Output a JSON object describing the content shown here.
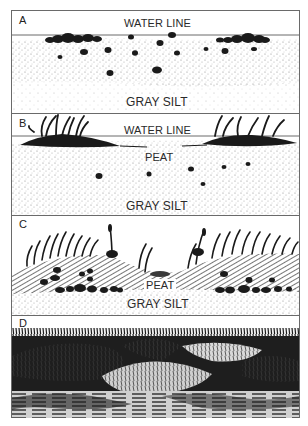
{
  "figure": {
    "panels": [
      {
        "id": "A",
        "label": "A",
        "labels": {
          "water_line": "WATER LINE",
          "silt": "GRAY SILT"
        }
      },
      {
        "id": "B",
        "label": "B",
        "labels": {
          "water_line": "WATER LINE",
          "peat": "PEAT",
          "silt": "GRAY SILT"
        }
      },
      {
        "id": "C",
        "label": "C",
        "labels": {
          "peat": "PEAT",
          "silt": "GRAY SILT"
        }
      },
      {
        "id": "D",
        "label": "D",
        "labels": {}
      }
    ],
    "colors": {
      "ink": "#1a1a1a",
      "frame": "#6a6a6a",
      "silt_stipple": "#9a9a9a",
      "paper": "#ffffff"
    }
  }
}
